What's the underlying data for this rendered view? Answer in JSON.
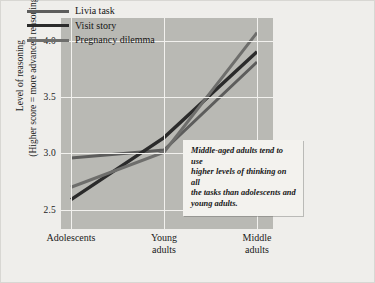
{
  "chart_data": {
    "type": "line",
    "title": "",
    "xlabel": "",
    "ylabel": "Level of reasoning (Higher score = more advanced reasoning)",
    "ylabel_line1": "Level of reasoning",
    "ylabel_line2": "(Higher score = more advanced reasoning)",
    "categories": [
      "Adolescents",
      "Young adults",
      "Middle adults"
    ],
    "category_lines": [
      [
        "Adolescents"
      ],
      [
        "Young",
        "adults"
      ],
      [
        "Middle",
        "adults"
      ]
    ],
    "yticks": [
      2.5,
      3.0,
      3.5,
      4.0
    ],
    "ytick_labels": [
      "2.5",
      "3.0",
      "3.5",
      "4.0"
    ],
    "ylim": [
      2.33,
      4.2
    ],
    "grid": true,
    "legend_position": "top-left",
    "series": [
      {
        "name": "Livia task",
        "values": [
          2.96,
          3.03,
          3.81
        ],
        "color": "#5d5d5c",
        "width": 3.0
      },
      {
        "name": "Visit story",
        "values": [
          2.59,
          3.14,
          3.9
        ],
        "color": "#2b2b2b",
        "width": 3.4
      },
      {
        "name": "Pregnancy dilemma",
        "values": [
          2.7,
          3.01,
          4.07
        ],
        "color": "#6e6e6c",
        "width": 3.0
      }
    ],
    "annotation": "Middle-aged adults tend to use higher levels of thinking on all the tasks than adolescents and young adults.",
    "annotation_lines": [
      "Middle-aged adults tend to use",
      "higher levels of thinking on all",
      "the tasks than adolescents and",
      "young adults."
    ]
  },
  "colors": {
    "plot_background": "#b9b9b4",
    "page_background": "#efeeeb",
    "gridline": "#f2f1ee",
    "text": "#1a1a1a",
    "annotation_background": "#f3f2ee"
  }
}
